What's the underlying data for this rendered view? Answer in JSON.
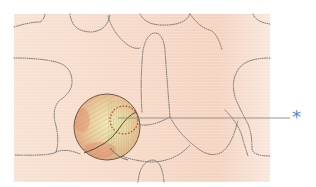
{
  "figure": {
    "background_color": "#fbe6da",
    "outline_color": "#6a6a6a",
    "highlight_circle_fill": "#e9c9a6",
    "inner_marker_color": "#c0393b",
    "leader_line_color": "#8a8a8a",
    "callout": {
      "label": "*",
      "color": "#3f8fd0"
    }
  }
}
